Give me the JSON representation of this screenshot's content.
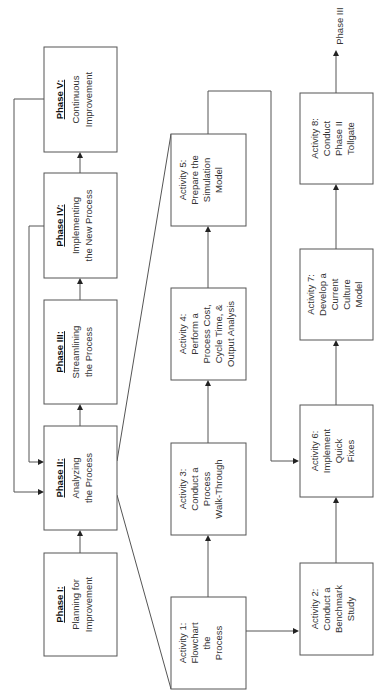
{
  "phases": [
    {
      "id": "phase-1",
      "title": "Phase I:",
      "lines": [
        "Planning for",
        "Improvement"
      ]
    },
    {
      "id": "phase-2",
      "title": "Phase II:",
      "lines": [
        "Analyzing",
        "the Process"
      ]
    },
    {
      "id": "phase-3",
      "title": "Phase III:",
      "lines": [
        "Streamlining",
        "the Process"
      ]
    },
    {
      "id": "phase-4",
      "title": "Phase IV:",
      "lines": [
        "Implementing",
        "the New Process"
      ]
    },
    {
      "id": "phase-5",
      "title": "Phase V:",
      "lines": [
        "Continuous",
        "Improvement"
      ]
    }
  ],
  "activities": [
    {
      "id": "activity-1",
      "lines": [
        "Activity 1:",
        "Flowchart",
        "the",
        "Process"
      ]
    },
    {
      "id": "activity-2",
      "lines": [
        "Activity 2:",
        "Conduct a",
        "Benchmark",
        "Study"
      ]
    },
    {
      "id": "activity-3",
      "lines": [
        "Activity 3:",
        "Conduct a",
        "Process",
        "Walk-Through"
      ]
    },
    {
      "id": "activity-4",
      "lines": [
        "Activity 4:",
        "Perform a",
        "Process Cost,",
        "Cycle Time, &",
        "Output Analysis"
      ]
    },
    {
      "id": "activity-5",
      "lines": [
        "Activity 5:",
        "Prepare the",
        "Simulation",
        "Model"
      ]
    },
    {
      "id": "activity-6",
      "lines": [
        "Activity 6:",
        "Implement",
        "Quick",
        "Fixes"
      ]
    },
    {
      "id": "activity-7",
      "lines": [
        "Activity 7:",
        "Develop a",
        "Current",
        "Culture",
        "Model"
      ]
    },
    {
      "id": "activity-8",
      "lines": [
        "Activity 8:",
        "Conduct",
        "Phase II",
        "Tollgate"
      ]
    }
  ],
  "exit_label": "Phase III",
  "colors": {
    "stroke": "#555555",
    "text": "#333333",
    "background": "#ffffff"
  }
}
